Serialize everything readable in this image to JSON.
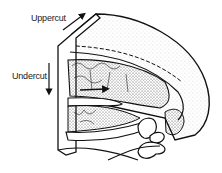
{
  "figure": {
    "labels": {
      "uppercut": "Uppercut",
      "undercut": "Undercut"
    },
    "arrows": [
      {
        "name": "uppercut-arrow",
        "direction": "up-right"
      },
      {
        "name": "undercut-arrow",
        "direction": "down"
      }
    ],
    "colors": {
      "ink": "#111111",
      "background": "#ffffff",
      "stipple": "#555555"
    }
  }
}
